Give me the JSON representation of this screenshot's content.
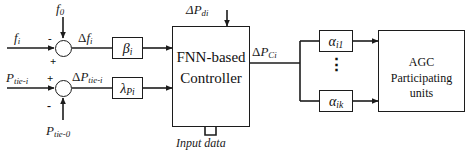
{
  "diagram": {
    "colors": {
      "line": "#1c1c1c",
      "text": "#111111",
      "background": "#ffffff"
    },
    "inputs": {
      "frequency_actual": "f",
      "frequency_actual_sub": "i",
      "frequency_reference": "f",
      "frequency_reference_sub": "0",
      "tie_power_actual": "P",
      "tie_power_actual_sub": "tie-i",
      "tie_power_reference": "P",
      "tie_power_reference_sub": "tie-0",
      "load_disturbance": "ΔP",
      "load_disturbance_sub": "di",
      "input_data": "Input data"
    },
    "signals": {
      "delta_f": "Δf",
      "delta_f_sub": "i",
      "delta_ptie": "ΔP",
      "delta_ptie_sub": "tie-i",
      "delta_pc": "ΔP",
      "delta_pc_sub": "Ci"
    },
    "signs": {
      "minus": "-",
      "plus": "+"
    },
    "gains": {
      "beta": "β",
      "beta_sub": "i",
      "lambda": "λ",
      "lambda_sub": "Pi"
    },
    "controller": {
      "line1": "FNN-based",
      "line2": "Controller"
    },
    "alphas": [
      {
        "symbol": "α",
        "sub": "i1"
      },
      {
        "symbol": "α",
        "sub": "ik"
      }
    ],
    "vertical_ellipsis": "⋮",
    "agc": {
      "line1": "AGC",
      "line2": "Participating units"
    }
  }
}
